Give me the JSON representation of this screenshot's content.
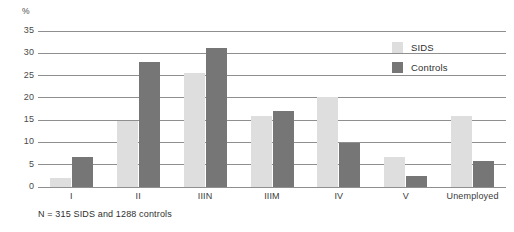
{
  "chart_data": {
    "type": "bar",
    "title": "",
    "subtitle": "",
    "xlabel": "",
    "ylabel": "%",
    "ylim": [
      0,
      35
    ],
    "ytick_step": 5,
    "yticks": [
      0,
      5,
      10,
      15,
      20,
      25,
      30,
      35
    ],
    "ytick_labels": [
      "0",
      "5",
      "10",
      "15",
      "20",
      "25",
      "30",
      "35"
    ],
    "grid": "horizontal",
    "legend_position": "upper-right-inside",
    "categories": [
      "I",
      "II",
      "IIIN",
      "IIIM",
      "IV",
      "V",
      "Unemployed"
    ],
    "series": [
      {
        "name": "SIDS",
        "color": "#dedede",
        "values": [
          2.0,
          14.8,
          25.6,
          16.0,
          20.2,
          6.8,
          15.9
        ]
      },
      {
        "name": "Controls",
        "color": "#767676",
        "values": [
          6.7,
          28.0,
          31.2,
          17.1,
          9.8,
          2.4,
          5.8
        ]
      }
    ],
    "annotations": [
      "N = 315 SIDS and 1288 controls"
    ]
  },
  "axis": {
    "y_unit_label": "%"
  },
  "legend": {
    "items": [
      {
        "label": "SIDS"
      },
      {
        "label": "Controls"
      }
    ]
  },
  "footnote": {
    "text": "N = 315 SIDS and 1288 controls"
  }
}
